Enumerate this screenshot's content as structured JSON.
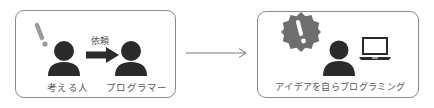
{
  "left_panel": {
    "request_label": "依頼",
    "person_left_label": "考える人",
    "person_right_label": "プログラマー"
  },
  "right_panel": {
    "caption": "アイデアを自らプログラミング"
  },
  "colors": {
    "person": "#2b2b2b",
    "exclamation_light": "#9a9a9a",
    "badge": "#6e6e6e",
    "border": "#8a8a8a",
    "text": "#555555"
  }
}
